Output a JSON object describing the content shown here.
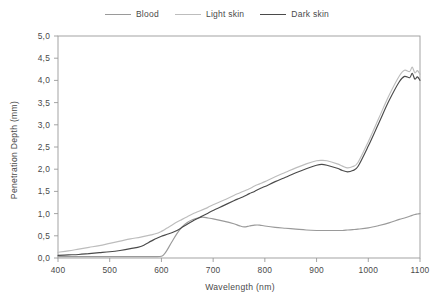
{
  "legend": {
    "position": "top-center",
    "entries": [
      {
        "label": "Blood",
        "color": "#9a9a9a"
      },
      {
        "label": "Light skin",
        "color": "#bdbdbd"
      },
      {
        "label": "Dark skin",
        "color": "#4a4a4a"
      }
    ]
  },
  "chart_data": {
    "type": "line",
    "title": "",
    "xlabel": "Wavelength (nm)",
    "ylabel": "Penetration Depth (mm)",
    "xlim": [
      400,
      1100
    ],
    "ylim": [
      0.0,
      5.0
    ],
    "xticks": [
      400,
      500,
      600,
      700,
      800,
      900,
      1000,
      1100
    ],
    "xticklabels": [
      "400",
      "500",
      "600",
      "700",
      "800",
      "900",
      "1000",
      "1100"
    ],
    "yticks": [
      0.0,
      0.5,
      1.0,
      1.5,
      2.0,
      2.5,
      3.0,
      3.5,
      4.0,
      4.5,
      5.0
    ],
    "yticklabels": [
      "0,0",
      "0,5",
      "1,0",
      "1,5",
      "2,0",
      "2,5",
      "3,0",
      "3,5",
      "4,0",
      "4,5",
      "5,0"
    ],
    "grid": false,
    "decimal_separator": ",",
    "x": [
      400,
      420,
      440,
      460,
      480,
      500,
      520,
      540,
      560,
      580,
      590,
      600,
      605,
      610,
      620,
      630,
      640,
      650,
      660,
      670,
      680,
      690,
      700,
      720,
      740,
      750,
      760,
      770,
      780,
      790,
      800,
      820,
      840,
      860,
      880,
      900,
      910,
      920,
      940,
      950,
      960,
      970,
      980,
      1000,
      1020,
      1040,
      1060,
      1070,
      1080,
      1085,
      1090,
      1095,
      1100
    ],
    "series": [
      {
        "name": "Blood",
        "color": "#9a9a9a",
        "values": [
          0.03,
          0.03,
          0.03,
          0.03,
          0.03,
          0.03,
          0.03,
          0.03,
          0.03,
          0.03,
          0.03,
          0.04,
          0.08,
          0.16,
          0.36,
          0.55,
          0.7,
          0.8,
          0.86,
          0.9,
          0.92,
          0.9,
          0.88,
          0.83,
          0.77,
          0.73,
          0.7,
          0.72,
          0.74,
          0.74,
          0.72,
          0.69,
          0.67,
          0.65,
          0.63,
          0.62,
          0.62,
          0.62,
          0.62,
          0.62,
          0.63,
          0.64,
          0.65,
          0.68,
          0.73,
          0.79,
          0.87,
          0.9,
          0.94,
          0.96,
          0.98,
          0.99,
          1.0
        ]
      },
      {
        "name": "Light skin",
        "color": "#bdbdbd",
        "values": [
          0.13,
          0.16,
          0.2,
          0.24,
          0.28,
          0.33,
          0.38,
          0.43,
          0.47,
          0.52,
          0.55,
          0.6,
          0.63,
          0.67,
          0.74,
          0.81,
          0.87,
          0.93,
          0.99,
          1.04,
          1.09,
          1.14,
          1.2,
          1.3,
          1.41,
          1.46,
          1.51,
          1.56,
          1.62,
          1.67,
          1.72,
          1.83,
          1.93,
          2.03,
          2.12,
          2.19,
          2.2,
          2.19,
          2.12,
          2.07,
          2.03,
          2.06,
          2.15,
          2.62,
          3.14,
          3.66,
          4.1,
          4.23,
          4.2,
          4.3,
          4.17,
          4.22,
          4.14
        ]
      },
      {
        "name": "Dark skin",
        "color": "#4a4a4a",
        "values": [
          0.06,
          0.07,
          0.08,
          0.1,
          0.12,
          0.14,
          0.17,
          0.21,
          0.26,
          0.38,
          0.44,
          0.49,
          0.51,
          0.53,
          0.57,
          0.62,
          0.69,
          0.76,
          0.83,
          0.89,
          0.95,
          1.01,
          1.07,
          1.18,
          1.29,
          1.34,
          1.39,
          1.45,
          1.5,
          1.56,
          1.61,
          1.72,
          1.82,
          1.92,
          2.01,
          2.09,
          2.11,
          2.09,
          2.02,
          1.97,
          1.94,
          1.97,
          2.06,
          2.52,
          3.03,
          3.54,
          3.97,
          4.09,
          4.06,
          4.16,
          4.03,
          4.08,
          4.0
        ]
      }
    ]
  }
}
